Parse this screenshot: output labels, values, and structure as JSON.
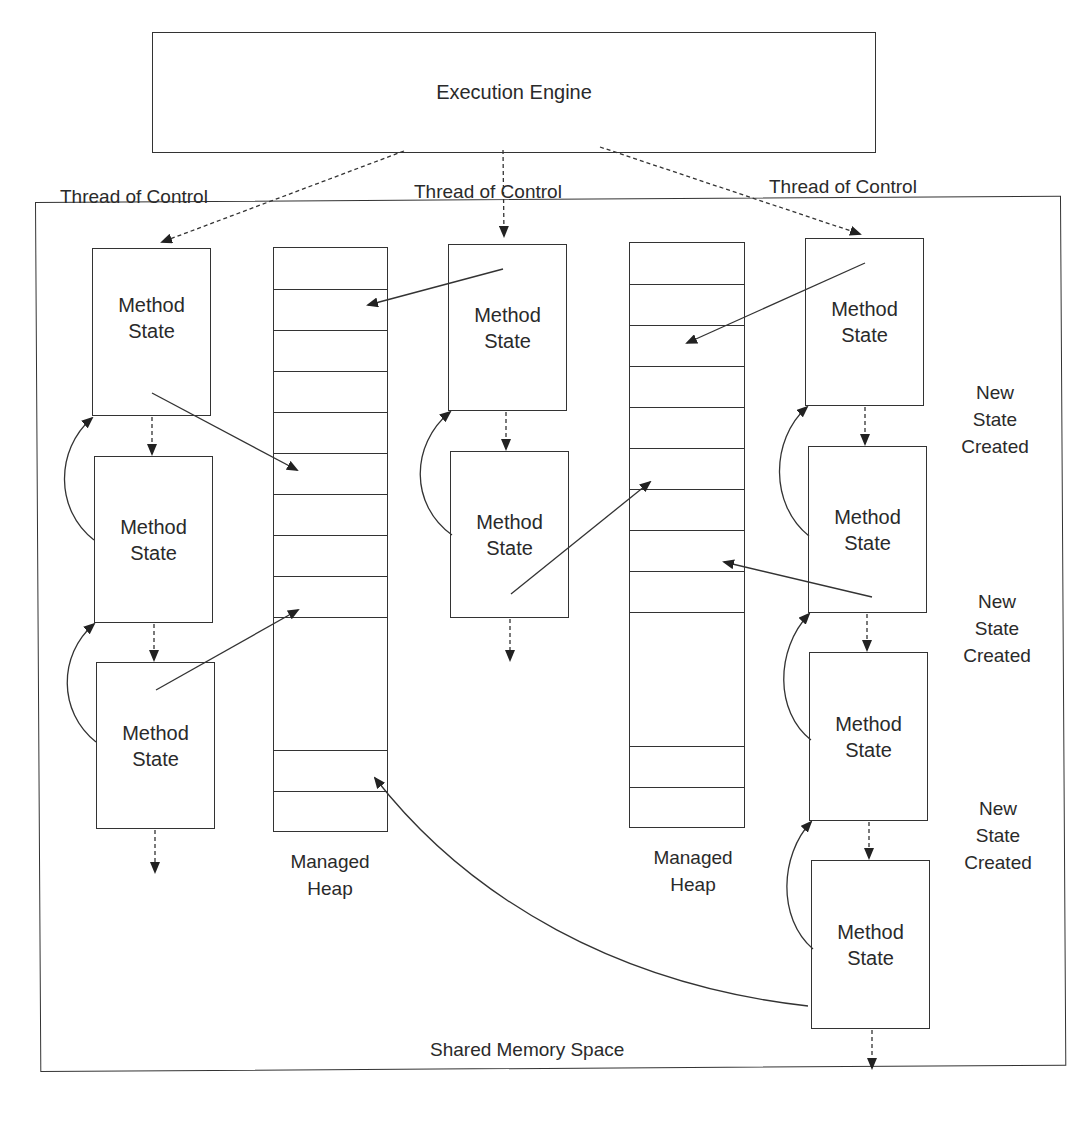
{
  "diagram": {
    "engine": {
      "label": "Execution Engine"
    },
    "threads": [
      {
        "label": "Thread of Control"
      },
      {
        "label": "Thread of Control"
      },
      {
        "label": "Thread of Control"
      }
    ],
    "method_state_label": {
      "line1": "Method",
      "line2": "State"
    },
    "thread1_states": 3,
    "thread2_states": 2,
    "thread3_states": 4,
    "heaps": [
      {
        "label_line1": "Managed",
        "label_line2": "Heap"
      },
      {
        "label_line1": "Managed",
        "label_line2": "Heap"
      }
    ],
    "new_state_notes": [
      {
        "line1": "New",
        "line2": "State",
        "line3": "Created"
      },
      {
        "line1": "New",
        "line2": "State",
        "line3": "Created"
      },
      {
        "line1": "New",
        "line2": "State",
        "line3": "Created"
      }
    ],
    "shared_memory": {
      "label": "Shared Memory Space"
    },
    "colors": {
      "stroke": "#333333",
      "text": "#2a2a2a",
      "background": "#ffffff"
    }
  }
}
